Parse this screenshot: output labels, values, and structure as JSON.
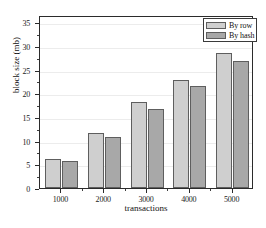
{
  "chart_data": {
    "type": "bar",
    "title": "",
    "xlabel": "transactions",
    "ylabel": "block size (mb)",
    "categories": [
      "1000",
      "2000",
      "3000",
      "4000",
      "5000"
    ],
    "series": [
      {
        "name": "By row",
        "values": [
          6.1,
          11.6,
          18.2,
          22.8,
          28.4
        ],
        "color": "#cfcfcf"
      },
      {
        "name": "By hash",
        "values": [
          5.6,
          10.8,
          16.7,
          21.5,
          26.9
        ],
        "color": "#a8a8a8"
      }
    ],
    "ylim": [
      0,
      36.5
    ],
    "yticks": [
      0,
      5,
      10,
      15,
      20,
      25,
      30,
      35
    ],
    "ytick_labels": [
      "0",
      "5",
      "10",
      "15",
      "20",
      "25",
      "30",
      "35"
    ],
    "grid": true,
    "legend_position": "top-right"
  },
  "legend": {
    "entries": [
      {
        "label": "By row"
      },
      {
        "label": "By hash"
      }
    ]
  },
  "axes": {
    "x_title": "transactions",
    "y_title": "block size (mb)"
  }
}
